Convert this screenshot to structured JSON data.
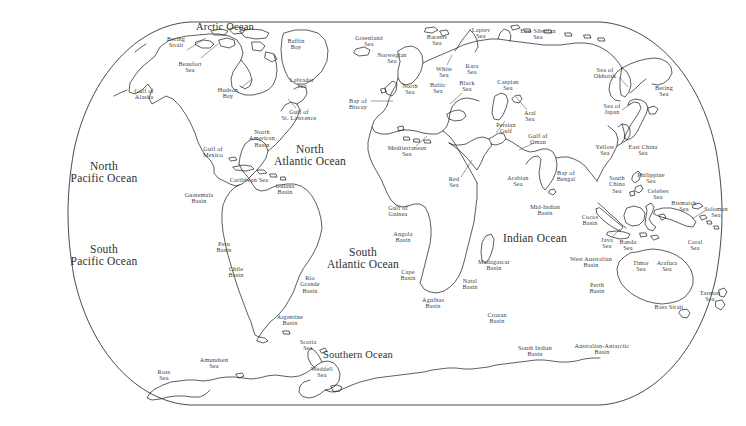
{
  "map": {
    "title": "World Ocean and Sea Names Map",
    "projection": "winkel-tripel",
    "background_color": "#ffffff",
    "coastline_color": "#1a1a1a",
    "label_color": "#3a3a3a",
    "frame": {
      "top_y": 22,
      "bottom_y": 405,
      "left_x": 30,
      "right_x": 716
    }
  },
  "oceans": [
    {
      "name": "arctic-ocean",
      "text": "Arctic Ocean",
      "x": 225,
      "y": 27,
      "size": "ocean-minor"
    },
    {
      "name": "north-pacific-ocean",
      "text": "North\nPacific Ocean",
      "x": 104,
      "y": 172,
      "size": "ocean-major"
    },
    {
      "name": "south-pacific-ocean",
      "text": "South\nPacific Ocean",
      "x": 104,
      "y": 255,
      "size": "ocean-major"
    },
    {
      "name": "north-atlantic-ocean",
      "text": "North\nAtlantic Ocean",
      "x": 310,
      "y": 155,
      "size": "ocean-major"
    },
    {
      "name": "south-atlantic-ocean",
      "text": "South\nAtlantic Ocean",
      "x": 363,
      "y": 258,
      "size": "ocean-major"
    },
    {
      "name": "indian-ocean",
      "text": "Indian Ocean",
      "x": 535,
      "y": 238,
      "size": "ocean-major"
    },
    {
      "name": "southern-ocean",
      "text": "Southern Ocean",
      "x": 358,
      "y": 355,
      "size": "ocean-minor"
    }
  ],
  "seas": [
    {
      "name": "bering-strait",
      "text": "Bering\nStrait",
      "x": 176,
      "y": 42
    },
    {
      "name": "beaufort-sea",
      "text": "Beaufort\nSea",
      "x": 190,
      "y": 67
    },
    {
      "name": "gulf-of-alaska",
      "text": "Gulf of\nAlaska",
      "x": 144,
      "y": 94
    },
    {
      "name": "hudson-bay",
      "text": "Hudson\nBay",
      "x": 228,
      "y": 93
    },
    {
      "name": "baffin-bay",
      "text": "Baffin\nBay",
      "x": 296,
      "y": 44
    },
    {
      "name": "labrador-sea",
      "text": "Labrador\nSea",
      "x": 302,
      "y": 83
    },
    {
      "name": "gulf-of-st-lawrence",
      "text": "Gulf of\nSt. Lawrence",
      "x": 299,
      "y": 115
    },
    {
      "name": "north-american-basin",
      "text": "North\nAmerican\nBasin",
      "x": 262,
      "y": 138
    },
    {
      "name": "gulf-of-mexico",
      "text": "Gulf of\nMexico",
      "x": 213,
      "y": 152
    },
    {
      "name": "caribbean-sea",
      "text": "Caribbean Sea",
      "x": 249,
      "y": 180
    },
    {
      "name": "guatemala-basin",
      "text": "Guatemala\nBasin",
      "x": 199,
      "y": 198
    },
    {
      "name": "guiana-basin",
      "text": "Guiana\nBasin",
      "x": 285,
      "y": 189
    },
    {
      "name": "peru-basin",
      "text": "Peru\nBasin",
      "x": 224,
      "y": 247
    },
    {
      "name": "chile-basin",
      "text": "Chile\nBasin",
      "x": 236,
      "y": 272
    },
    {
      "name": "rio-grande-basin",
      "text": "Rio\nGrande\nBasin",
      "x": 310,
      "y": 284
    },
    {
      "name": "argentine-basin",
      "text": "Argentine\nBasin",
      "x": 290,
      "y": 320
    },
    {
      "name": "greenland-sea",
      "text": "Greenland\nSea",
      "x": 369,
      "y": 41
    },
    {
      "name": "norwegian-sea",
      "text": "Norwegian\nSea",
      "x": 392,
      "y": 58
    },
    {
      "name": "barents-sea",
      "text": "Barents\nSea",
      "x": 437,
      "y": 40
    },
    {
      "name": "laptev-sea",
      "text": "Laptev\nSea",
      "x": 481,
      "y": 33
    },
    {
      "name": "east-siberian-sea",
      "text": "East Siberian\nSea",
      "x": 538,
      "y": 34
    },
    {
      "name": "white-sea",
      "text": "White\nSea",
      "x": 444,
      "y": 72
    },
    {
      "name": "kara-sea",
      "text": "Kara\nSea",
      "x": 472,
      "y": 69
    },
    {
      "name": "north-sea",
      "text": "North\nSea",
      "x": 410,
      "y": 89
    },
    {
      "name": "baltic-sea",
      "text": "Baltic\nSea",
      "x": 438,
      "y": 88
    },
    {
      "name": "black-sea",
      "text": "Black\nSea",
      "x": 467,
      "y": 86
    },
    {
      "name": "caspian-sea",
      "text": "Caspian\nSea",
      "x": 508,
      "y": 85
    },
    {
      "name": "aral-sea",
      "text": "Aral\nSea",
      "x": 530,
      "y": 116
    },
    {
      "name": "bay-of-biscay",
      "text": "Bay of\nBiscay",
      "x": 358,
      "y": 104
    },
    {
      "name": "mediterranean-sea",
      "text": "Mediterranean\nSea",
      "x": 407,
      "y": 151
    },
    {
      "name": "persian-gulf",
      "text": "Persian\nGulf",
      "x": 506,
      "y": 128
    },
    {
      "name": "gulf-of-oman",
      "text": "Gulf of\nOman",
      "x": 538,
      "y": 139
    },
    {
      "name": "red-sea",
      "text": "Red\nSea",
      "x": 454,
      "y": 182
    },
    {
      "name": "arabian-sea",
      "text": "Arabian\nSea",
      "x": 518,
      "y": 181
    },
    {
      "name": "bay-of-bengal",
      "text": "Bay of\nBengal",
      "x": 566,
      "y": 176
    },
    {
      "name": "mid-indian-basin",
      "text": "Mid-Indian\nBasin",
      "x": 545,
      "y": 210
    },
    {
      "name": "cocos-basin",
      "text": "Cocos\nBasin",
      "x": 590,
      "y": 220
    },
    {
      "name": "gulf-of-guinea",
      "text": "Gulf of\nGuinea",
      "x": 398,
      "y": 211
    },
    {
      "name": "angola-basin",
      "text": "Angola\nBasin",
      "x": 403,
      "y": 237
    },
    {
      "name": "cape-basin",
      "text": "Cape\nBasin",
      "x": 408,
      "y": 275
    },
    {
      "name": "agulhas-basin",
      "text": "Agulhas\nBasin",
      "x": 433,
      "y": 303
    },
    {
      "name": "natal-basin",
      "text": "Natal\nBasin",
      "x": 470,
      "y": 284
    },
    {
      "name": "madagascar-basin",
      "text": "Madagascar\nBasin",
      "x": 494,
      "y": 265
    },
    {
      "name": "crozan-basin",
      "text": "Crozan\nBasin",
      "x": 497,
      "y": 318
    },
    {
      "name": "south-indian-basin",
      "text": "South Indian\nBasin",
      "x": 535,
      "y": 351
    },
    {
      "name": "australian-antarctic-basin",
      "text": "Australian-Antarctic\nBasin",
      "x": 602,
      "y": 349
    },
    {
      "name": "sea-of-okhotsk",
      "text": "Sea of\nOkhotsk",
      "x": 605,
      "y": 73
    },
    {
      "name": "bering-sea",
      "text": "Bering\nSea",
      "x": 664,
      "y": 91
    },
    {
      "name": "sea-of-japan",
      "text": "Sea of\nJapan",
      "x": 612,
      "y": 109
    },
    {
      "name": "yellow-sea",
      "text": "Yellow\nSea",
      "x": 605,
      "y": 150
    },
    {
      "name": "east-china-sea",
      "text": "East China\nSea",
      "x": 643,
      "y": 150
    },
    {
      "name": "philippine-sea",
      "text": "Philippine\nSea",
      "x": 651,
      "y": 178
    },
    {
      "name": "south-china-sea",
      "text": "South\nChina\nSea",
      "x": 617,
      "y": 184
    },
    {
      "name": "celebes-sea",
      "text": "Celebes\nSea",
      "x": 658,
      "y": 194
    },
    {
      "name": "bismarck-sea",
      "text": "Bismarck\nSea",
      "x": 684,
      "y": 206
    },
    {
      "name": "solomon-sea",
      "text": "Solomon\nSea",
      "x": 716,
      "y": 212
    },
    {
      "name": "java-sea",
      "text": "Java\nSea",
      "x": 607,
      "y": 243
    },
    {
      "name": "banda-sea",
      "text": "Banda\nSea",
      "x": 628,
      "y": 245
    },
    {
      "name": "coral-sea",
      "text": "Coral\nSea",
      "x": 695,
      "y": 245
    },
    {
      "name": "west-australian-basin",
      "text": "West Australian\nBasin",
      "x": 591,
      "y": 262
    },
    {
      "name": "timor-sea",
      "text": "Timor\nSea",
      "x": 641,
      "y": 266
    },
    {
      "name": "arafura-sea",
      "text": "Arafura\nSea",
      "x": 667,
      "y": 266
    },
    {
      "name": "perth-basin",
      "text": "Perth\nBasin",
      "x": 597,
      "y": 288
    },
    {
      "name": "tasman-sea",
      "text": "Tasman\nSea",
      "x": 710,
      "y": 296
    },
    {
      "name": "bass-strait",
      "text": "Bass Strait",
      "x": 669,
      "y": 307
    },
    {
      "name": "scotia-sea",
      "text": "Scotia\nSea",
      "x": 308,
      "y": 345
    },
    {
      "name": "amundsen-sea",
      "text": "Amundsen\nSea",
      "x": 214,
      "y": 363
    },
    {
      "name": "ross-sea",
      "text": "Ross\nSea",
      "x": 164,
      "y": 375
    },
    {
      "name": "weddell-sea",
      "text": "Weddell\nSea",
      "x": 322,
      "y": 372
    }
  ],
  "leaders": [
    {
      "name": "leader-bering-strait",
      "x1": 187,
      "y1": 50,
      "x2": 206,
      "y2": 38
    },
    {
      "name": "leader-beaufort-sea",
      "x1": 201,
      "y1": 58,
      "x2": 218,
      "y2": 44
    },
    {
      "name": "leader-hudson-bay",
      "x1": 241,
      "y1": 88,
      "x2": 252,
      "y2": 79
    },
    {
      "name": "leader-white-sea",
      "x1": 447,
      "y1": 65,
      "x2": 452,
      "y2": 55
    },
    {
      "name": "leader-black-sea",
      "x1": 462,
      "y1": 93,
      "x2": 450,
      "y2": 104
    },
    {
      "name": "leader-bay-of-biscay",
      "x1": 371,
      "y1": 101,
      "x2": 393,
      "y2": 101
    },
    {
      "name": "leader-aral-sea",
      "x1": 527,
      "y1": 110,
      "x2": 516,
      "y2": 97
    },
    {
      "name": "leader-persian-gulf",
      "x1": 505,
      "y1": 121,
      "x2": 496,
      "y2": 133
    },
    {
      "name": "leader-gulf-of-oman",
      "x1": 534,
      "y1": 143,
      "x2": 519,
      "y2": 150
    },
    {
      "name": "leader-red-sea",
      "x1": 461,
      "y1": 177,
      "x2": 472,
      "y2": 160
    },
    {
      "name": "leader-mediterranean",
      "x1": 416,
      "y1": 146,
      "x2": 427,
      "y2": 136
    },
    {
      "name": "leader-sea-of-okhotsk",
      "x1": 619,
      "y1": 77,
      "x2": 628,
      "y2": 87
    },
    {
      "name": "leader-sea-of-japan",
      "x1": 622,
      "y1": 110,
      "x2": 631,
      "y2": 104
    },
    {
      "name": "leader-solomon-sea",
      "x1": 706,
      "y1": 210,
      "x2": 692,
      "y2": 219
    },
    {
      "name": "leader-java-sea",
      "x1": 612,
      "y1": 237,
      "x2": 620,
      "y2": 229
    },
    {
      "name": "leader-gulf-of-st-lawrence",
      "x1": 296,
      "y1": 108,
      "x2": 288,
      "y2": 99
    }
  ]
}
